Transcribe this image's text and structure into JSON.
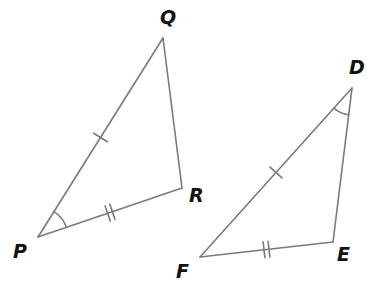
{
  "figure": {
    "kind": "geometry-diagram",
    "background_color": "#ffffff",
    "stroke_color": "#7a7a7a",
    "label_color": "#111111",
    "stroke_width": 1.6,
    "width": 386,
    "height": 288
  },
  "triangles": [
    {
      "name": "PQR",
      "vertices": [
        {
          "label": "P",
          "x": 38,
          "y": 237,
          "label_x": 13,
          "label_y": 242
        },
        {
          "label": "Q",
          "x": 163,
          "y": 38,
          "label_x": 160,
          "label_y": 8
        },
        {
          "label": "R",
          "x": 182,
          "y": 188,
          "label_x": 189,
          "label_y": 186
        }
      ],
      "sides": [
        {
          "from": "P",
          "to": "Q",
          "ticks": 1
        },
        {
          "from": "Q",
          "to": "R",
          "ticks": 0
        },
        {
          "from": "P",
          "to": "R",
          "ticks": 2
        }
      ],
      "angle_marks": [
        {
          "at": "P",
          "arcs": 1,
          "radius": 30
        }
      ]
    },
    {
      "name": "DEF",
      "vertices": [
        {
          "label": "D",
          "x": 352,
          "y": 88,
          "label_x": 349,
          "label_y": 58
        },
        {
          "label": "E",
          "x": 333,
          "y": 242,
          "label_x": 337,
          "label_y": 245
        },
        {
          "label": "F",
          "x": 200,
          "y": 257,
          "label_x": 176,
          "label_y": 262
        }
      ],
      "sides": [
        {
          "from": "D",
          "to": "F",
          "ticks": 1
        },
        {
          "from": "D",
          "to": "E",
          "ticks": 0
        },
        {
          "from": "F",
          "to": "E",
          "ticks": 2
        }
      ],
      "angle_marks": [
        {
          "at": "D",
          "arcs": 1,
          "radius": 27
        }
      ]
    }
  ],
  "tick_style": {
    "length": 16,
    "gap": 5,
    "width": 1.6
  }
}
